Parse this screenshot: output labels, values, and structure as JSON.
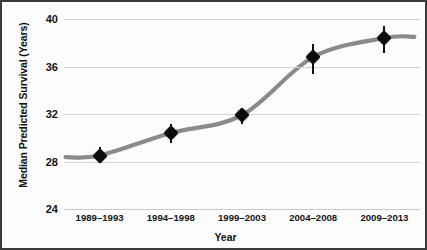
{
  "chart_data": {
    "type": "line",
    "title": "",
    "subtitle": "",
    "xlabel": "Year",
    "ylabel": "Median Predicted Survival (Years)",
    "categories": [
      "1989–1993",
      "1994–1998",
      "1999–2003",
      "2004–2008",
      "2009–2013"
    ],
    "values": [
      28.5,
      30.4,
      31.9,
      36.8,
      38.4
    ],
    "error_low": [
      27.9,
      29.6,
      31.2,
      35.4,
      37.1
    ],
    "error_high": [
      29.2,
      31.2,
      32.5,
      37.9,
      39.4
    ],
    "yticks": [
      24,
      28,
      32,
      36,
      40
    ],
    "ytick_labels": [
      "24",
      "28",
      "32",
      "36",
      "40"
    ],
    "ylim": [
      24,
      40
    ],
    "xlim_categories": 5,
    "grid": "horizontal",
    "legend": "none",
    "marker": "diamond",
    "marker_color": "#0c0c0c",
    "line_color": "#8a8a8a",
    "line_style": "smooth-sigmoid",
    "gridline_color": "#d2d2d2",
    "background_color": "#fcfcfc",
    "frame_color": "#3a3a3a",
    "annotations": []
  }
}
